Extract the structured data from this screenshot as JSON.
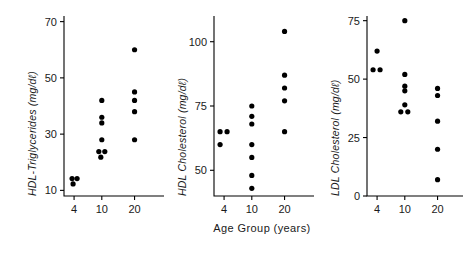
{
  "figure": {
    "xaxis_title": "Age Group  (years)",
    "x_categories": [
      "4",
      "10",
      "20"
    ]
  },
  "chart_data": [
    {
      "type": "scatter",
      "panel_index": 0,
      "title": "",
      "ylabel": "HDL-Triglycerides  (mg/dℓ)",
      "xlabel": "",
      "ylim": [
        8,
        72
      ],
      "yticks": [
        10,
        30,
        50,
        70
      ],
      "ytick_labels": [
        "10",
        "30",
        "50",
        "70"
      ],
      "grid": false,
      "categories": [
        "4",
        "10",
        "20"
      ],
      "points": [
        {
          "x": "4",
          "y": 14.2,
          "jitter": -2
        },
        {
          "x": "4",
          "y": 14.2,
          "jitter": 3
        },
        {
          "x": "4",
          "y": 12.3,
          "jitter": -1
        },
        {
          "x": "10",
          "y": 42.0,
          "jitter": 0
        },
        {
          "x": "10",
          "y": 36.0,
          "jitter": 0
        },
        {
          "x": "10",
          "y": 34.0,
          "jitter": 0
        },
        {
          "x": "10",
          "y": 28.0,
          "jitter": 0
        },
        {
          "x": "10",
          "y": 23.8,
          "jitter": -3
        },
        {
          "x": "10",
          "y": 23.8,
          "jitter": 3
        },
        {
          "x": "10",
          "y": 21.8,
          "jitter": -1
        },
        {
          "x": "20",
          "y": 60.0,
          "jitter": 0
        },
        {
          "x": "20",
          "y": 45.0,
          "jitter": 0
        },
        {
          "x": "20",
          "y": 42.0,
          "jitter": 0
        },
        {
          "x": "20",
          "y": 38.0,
          "jitter": 0
        },
        {
          "x": "20",
          "y": 28.0,
          "jitter": 0
        }
      ]
    },
    {
      "type": "scatter",
      "panel_index": 1,
      "title": "",
      "ylabel": "HDL Cholesterol  (mg/dℓ)",
      "xlabel": "Age Group  (years)",
      "ylim": [
        40,
        110
      ],
      "yticks": [
        50,
        75,
        100
      ],
      "ytick_labels": [
        "50",
        "75",
        "100"
      ],
      "grid": false,
      "categories": [
        "4",
        "10",
        "20"
      ],
      "points": [
        {
          "x": "4",
          "y": 65.0,
          "jitter": -4
        },
        {
          "x": "4",
          "y": 65.0,
          "jitter": 3
        },
        {
          "x": "4",
          "y": 60.0,
          "jitter": -4
        },
        {
          "x": "10",
          "y": 75.0,
          "jitter": 0
        },
        {
          "x": "10",
          "y": 71.0,
          "jitter": 0
        },
        {
          "x": "10",
          "y": 68.0,
          "jitter": 0
        },
        {
          "x": "10",
          "y": 60.0,
          "jitter": 0
        },
        {
          "x": "10",
          "y": 55.0,
          "jitter": 0
        },
        {
          "x": "10",
          "y": 48.0,
          "jitter": 0
        },
        {
          "x": "10",
          "y": 43.0,
          "jitter": 0
        },
        {
          "x": "20",
          "y": 104.0,
          "jitter": 0
        },
        {
          "x": "20",
          "y": 87.0,
          "jitter": 0
        },
        {
          "x": "20",
          "y": 82.0,
          "jitter": 0
        },
        {
          "x": "20",
          "y": 77.0,
          "jitter": 0
        },
        {
          "x": "20",
          "y": 65.0,
          "jitter": 0
        }
      ]
    },
    {
      "type": "scatter",
      "panel_index": 2,
      "title": "",
      "ylabel": "LDL Cholesterol  (mg/dℓ)",
      "xlabel": "",
      "ylim": [
        0,
        77
      ],
      "yticks": [
        0,
        25,
        50,
        75
      ],
      "ytick_labels": [
        "0",
        "25",
        "50",
        "75"
      ],
      "grid": false,
      "categories": [
        "4",
        "10",
        "20"
      ],
      "points": [
        {
          "x": "4",
          "y": 62.0,
          "jitter": 0
        },
        {
          "x": "4",
          "y": 54.0,
          "jitter": -4
        },
        {
          "x": "4",
          "y": 54.0,
          "jitter": 3
        },
        {
          "x": "10",
          "y": 75.0,
          "jitter": 0
        },
        {
          "x": "10",
          "y": 52.0,
          "jitter": 0
        },
        {
          "x": "10",
          "y": 47.0,
          "jitter": 0
        },
        {
          "x": "10",
          "y": 45.0,
          "jitter": 0
        },
        {
          "x": "10",
          "y": 39.0,
          "jitter": 0
        },
        {
          "x": "10",
          "y": 36.0,
          "jitter": -4
        },
        {
          "x": "10",
          "y": 36.0,
          "jitter": 3
        },
        {
          "x": "20",
          "y": 46.0,
          "jitter": 0
        },
        {
          "x": "20",
          "y": 43.0,
          "jitter": 0
        },
        {
          "x": "20",
          "y": 32.0,
          "jitter": 0
        },
        {
          "x": "20",
          "y": 20.0,
          "jitter": 0
        },
        {
          "x": "20",
          "y": 7.0,
          "jitter": 0
        }
      ]
    }
  ]
}
